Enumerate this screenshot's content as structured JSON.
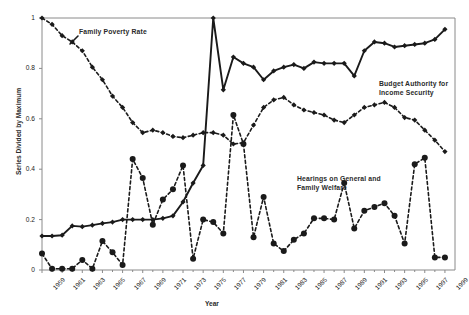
{
  "chart_data": {
    "type": "line",
    "title": "",
    "xlabel": "Year",
    "ylabel": "Series Divided by Maximum",
    "xlim": [
      1959,
      2000
    ],
    "ylim": [
      0,
      1
    ],
    "yticks": [
      0,
      0.2,
      0.4,
      0.6,
      0.8,
      1
    ],
    "ytick_labels": [
      "0",
      "0.2",
      "0.4",
      "0.6",
      "0.8",
      "1"
    ],
    "xticks": [
      1959,
      1961,
      1963,
      1965,
      1967,
      1969,
      1971,
      1973,
      1975,
      1977,
      1979,
      1981,
      1983,
      1985,
      1987,
      1989,
      1991,
      1993,
      1995,
      1997,
      1999
    ],
    "xtick_labels": [
      "1959",
      "1961",
      "1963",
      "1965",
      "1967",
      "1969",
      "1971",
      "1973",
      "1975",
      "1977",
      "1979",
      "1981",
      "1983",
      "1985",
      "1987",
      "1989",
      "1991",
      "1993",
      "1995",
      "1997",
      "1999"
    ],
    "grid": false,
    "legend_position": "inline-annotations",
    "x": [
      1959,
      1960,
      1961,
      1962,
      1963,
      1964,
      1965,
      1966,
      1967,
      1968,
      1969,
      1970,
      1971,
      1972,
      1973,
      1974,
      1975,
      1976,
      1977,
      1978,
      1979,
      1980,
      1981,
      1982,
      1983,
      1984,
      1985,
      1986,
      1987,
      1988,
      1989,
      1990,
      1991,
      1992,
      1993,
      1994,
      1995,
      1996,
      1997,
      1998,
      1999
    ],
    "series": [
      {
        "name": "Family Poverty Rate",
        "style": "dashed",
        "marker": "diamond",
        "color": "#1a1a1a",
        "values": [
          1.0,
          0.975,
          0.93,
          0.905,
          0.87,
          0.805,
          0.755,
          0.69,
          0.645,
          0.585,
          0.545,
          0.555,
          0.545,
          0.53,
          0.525,
          0.535,
          0.545,
          0.545,
          0.535,
          0.5,
          0.505,
          0.575,
          0.645,
          0.675,
          0.685,
          0.655,
          0.635,
          0.625,
          0.615,
          0.595,
          0.585,
          0.615,
          0.645,
          0.655,
          0.665,
          0.645,
          0.605,
          0.595,
          0.555,
          0.515,
          0.47
        ]
      },
      {
        "name": "Budget Authority for Income Security",
        "style": "solid",
        "marker": "diamond",
        "color": "#1a1a1a",
        "values": [
          0.135,
          0.135,
          0.138,
          0.175,
          0.172,
          0.178,
          0.185,
          0.19,
          0.2,
          0.2,
          0.2,
          0.2,
          0.205,
          0.215,
          0.27,
          0.345,
          0.415,
          1.0,
          0.715,
          0.845,
          0.82,
          0.805,
          0.755,
          0.79,
          0.805,
          0.815,
          0.8,
          0.825,
          0.82,
          0.82,
          0.82,
          0.77,
          0.87,
          0.905,
          0.9,
          0.885,
          0.89,
          0.895,
          0.9,
          0.915,
          0.955
        ]
      },
      {
        "name": "Hearings on General and Family Welfare",
        "style": "dashed",
        "marker": "circle",
        "color": "#1a1a1a",
        "values": [
          0.065,
          0.005,
          0.005,
          0.005,
          0.04,
          0.005,
          0.115,
          0.07,
          0.02,
          0.44,
          0.365,
          0.18,
          0.28,
          0.32,
          0.415,
          0.045,
          0.2,
          0.19,
          0.145,
          0.615,
          0.5,
          0.13,
          0.29,
          0.105,
          0.075,
          0.12,
          0.145,
          0.205,
          0.205,
          0.2,
          0.345,
          0.165,
          0.235,
          0.25,
          0.265,
          0.215,
          0.105,
          0.42,
          0.445,
          0.05,
          0.05
        ]
      }
    ],
    "annotations": [
      {
        "text": "Family Poverty Rate",
        "x": 1962,
        "y": 0.925
      },
      {
        "text": "Budget Authority for\nIncome Security",
        "x": 1992,
        "y": 0.8
      },
      {
        "text": "Hearings on General and\nFamily Welfare",
        "x": 1985,
        "y": 0.42
      }
    ]
  },
  "labels": {
    "series_poverty": "Family Poverty Rate",
    "series_budget": "Budget Authority for\nIncome Security",
    "series_hearings": "Hearings on General and\nFamily Welfare",
    "y_axis_title": "Series Divided by Maximum",
    "x_axis_title": "Year"
  }
}
